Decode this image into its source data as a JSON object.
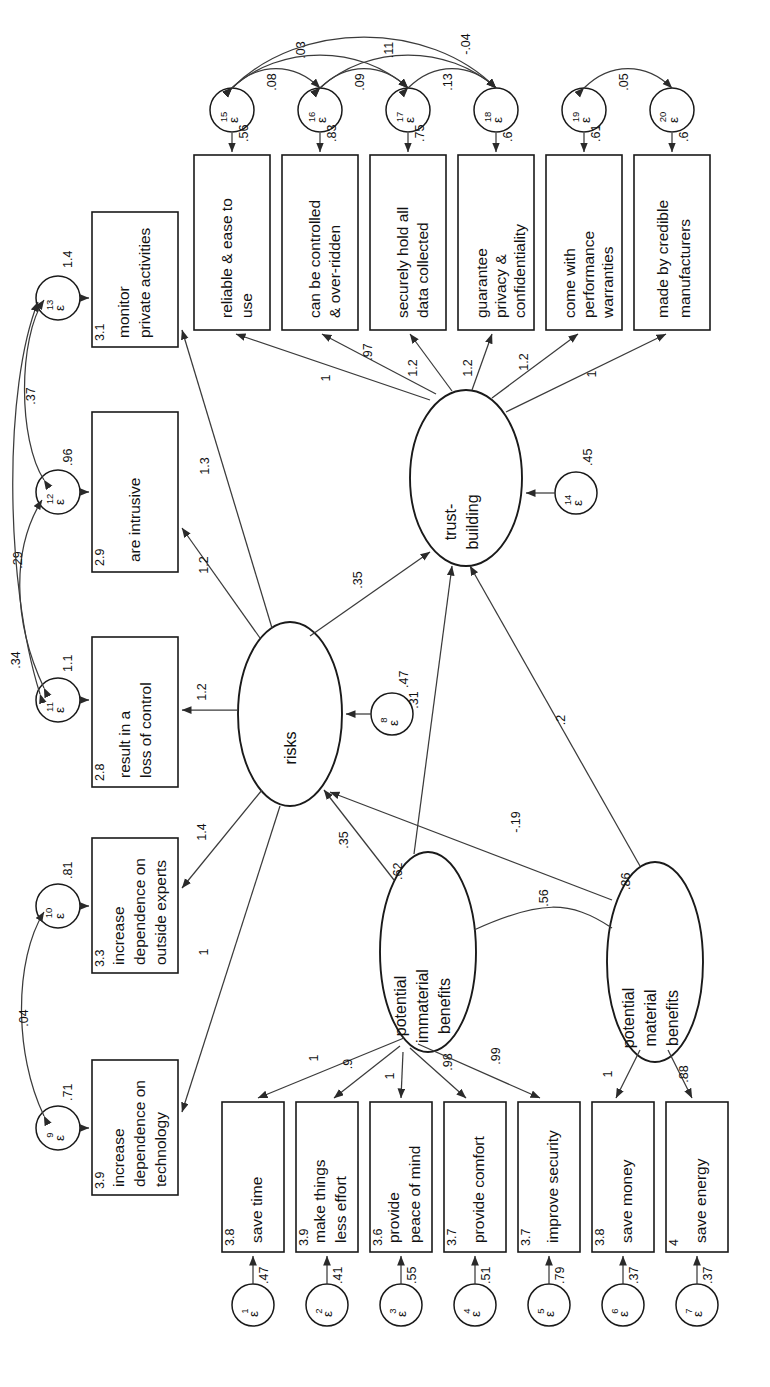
{
  "diagram": {
    "type": "structural-equation-model",
    "orientation": "rotated-90-ccw",
    "background": "#ffffff",
    "line_color": "#3b3b3b"
  },
  "latents": [
    {
      "id": "trust",
      "label_line1": "trust-",
      "label_line2": "building",
      "variance": ".45",
      "error": "ε",
      "error_sub": "14"
    },
    {
      "id": "risks",
      "label_line1": "risks",
      "label_line2": "",
      "variance": ".47",
      "error": "ε",
      "error_sub": "8"
    },
    {
      "id": "immaterial",
      "label_line1": "potential",
      "label_line2": "immaterial",
      "label_line3": "benefits",
      "variance": ".62"
    },
    {
      "id": "material",
      "label_line1": "potential",
      "label_line2": "material",
      "label_line3": "benefits",
      "variance": ".86"
    }
  ],
  "indicators": [
    {
      "id": "i15",
      "line1": "reliable & ease to",
      "line2": "use",
      "mean": "",
      "err": "ε",
      "err_sub": "15",
      "err_val": ".56",
      "load": "1"
    },
    {
      "id": "i16",
      "line1": "can be controlled",
      "line2": "& over-ridden",
      "mean": "",
      "err": "ε",
      "err_sub": "16",
      "err_val": ".83",
      "load": ".97"
    },
    {
      "id": "i17",
      "line1": "securely hold all",
      "line2": "data collected",
      "mean": "",
      "err": "ε",
      "err_sub": "17",
      "err_val": ".75",
      "load": "1.2"
    },
    {
      "id": "i18",
      "line1": "guarantee",
      "line2": "privacy &",
      "line3": "confidentiality",
      "mean": "",
      "err": "ε",
      "err_sub": "18",
      "err_val": ".6",
      "load": "1.2"
    },
    {
      "id": "i19",
      "line1": "come with",
      "line2": "performance",
      "line3": "warranties",
      "mean": "",
      "err": "ε",
      "err_sub": "19",
      "err_val": ".61",
      "load": "1.2"
    },
    {
      "id": "i20",
      "line1": "made by credible",
      "line2": "manufacturers",
      "mean": "",
      "err": "ε",
      "err_sub": "20",
      "err_val": ".6",
      "load": "1"
    },
    {
      "id": "i13",
      "line1": "monitor",
      "line2": "private activities",
      "mean": "3.1",
      "err": "ε",
      "err_sub": "13",
      "err_val": "1.4",
      "load": "1.3"
    },
    {
      "id": "i12",
      "line1": "are intrusive",
      "line2": "",
      "mean": "2.9",
      "err": "ε",
      "err_sub": "12",
      "err_val": ".96",
      "load": "1.2"
    },
    {
      "id": "i11",
      "line1": "result in a",
      "line2": "loss of control",
      "mean": "2.8",
      "err": "ε",
      "err_sub": "11",
      "err_val": "1.1",
      "load": "1.2"
    },
    {
      "id": "i10",
      "line1": "increase",
      "line2": "dependence on",
      "line3": "outside experts",
      "mean": "3.3",
      "err": "ε",
      "err_sub": "10",
      "err_val": ".81",
      "load": "1.4"
    },
    {
      "id": "i9",
      "line1": "increase",
      "line2": "dependence on",
      "line3": "technology",
      "mean": "3.9",
      "err": "ε",
      "err_sub": "9",
      "err_val": ".71",
      "load": "1"
    },
    {
      "id": "i1",
      "line1": "save time",
      "line2": "",
      "mean": "3.8",
      "err": "ε",
      "err_sub": "1",
      "err_val": ".47",
      "load": "1"
    },
    {
      "id": "i2",
      "line1": "make things",
      "line2": "less effort",
      "mean": "3.9",
      "err": "ε",
      "err_sub": "2",
      "err_val": ".41",
      "load": ".9"
    },
    {
      "id": "i3",
      "line1": "provide",
      "line2": "peace of mind",
      "mean": "3.6",
      "err": "ε",
      "err_sub": "3",
      "err_val": ".55",
      "load": "1"
    },
    {
      "id": "i4",
      "line1": "provide comfort",
      "line2": "",
      "mean": "3.7",
      "err": "ε",
      "err_sub": "4",
      "err_val": ".51",
      "load": ".98"
    },
    {
      "id": "i5",
      "line1": "improve security",
      "line2": "",
      "mean": "3.7",
      "err": "ε",
      "err_sub": "5",
      "err_val": ".79",
      "load": ".99"
    },
    {
      "id": "i6",
      "line1": "save money",
      "line2": "",
      "mean": "3.8",
      "err": "ε",
      "err_sub": "6",
      "err_val": ".37",
      "load": "1"
    },
    {
      "id": "i7",
      "line1": "save energy",
      "line2": "",
      "mean": "4",
      "err": "ε",
      "err_sub": "7",
      "err_val": ".37",
      "load": ".88"
    }
  ],
  "structural_paths": [
    {
      "id": "risks-to-trust",
      "from": "risks",
      "to": "trust",
      "value": ".35"
    },
    {
      "id": "immaterial-to-trust",
      "from": "immaterial",
      "to": "trust",
      "value": ".31"
    },
    {
      "id": "material-to-trust",
      "from": "material",
      "to": "trust",
      "value": ".2"
    },
    {
      "id": "immaterial-to-risks",
      "from": "immaterial",
      "to": "risks",
      "value": ".35"
    },
    {
      "id": "material-to-risks",
      "from": "material",
      "to": "risks",
      "value": "-.19"
    }
  ],
  "correlations": [
    {
      "id": "corr-e15-e16",
      "value": ".08"
    },
    {
      "id": "corr-e16-e17",
      "value": ".09"
    },
    {
      "id": "corr-e17-e18",
      "value": ".13"
    },
    {
      "id": "corr-e15-e17",
      "value": ".03"
    },
    {
      "id": "corr-e16-e18",
      "value": ".11"
    },
    {
      "id": "corr-e15-e18",
      "value": "-.04"
    },
    {
      "id": "corr-e19-e20",
      "value": ".05"
    },
    {
      "id": "corr-e12-e13",
      "value": ".37"
    },
    {
      "id": "corr-e11-e12",
      "value": ".29"
    },
    {
      "id": "corr-e11-e13",
      "value": ".34"
    },
    {
      "id": "corr-e9-e10",
      "value": ".04"
    },
    {
      "id": "corr-immaterial-material",
      "value": ".56"
    }
  ]
}
